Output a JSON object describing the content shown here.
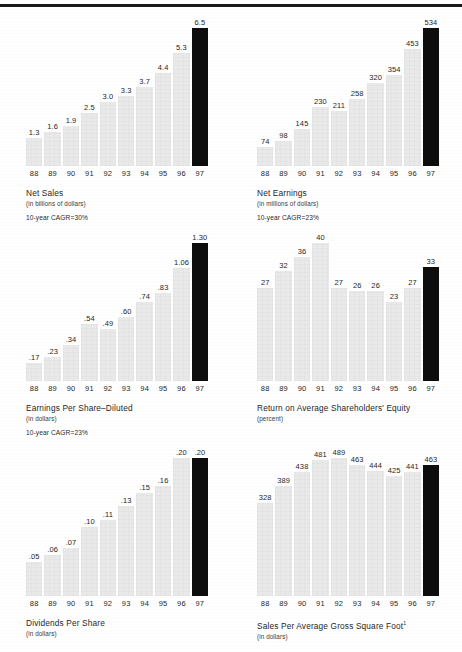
{
  "page": {
    "rule_color": "#1a1a1a",
    "bar_color": "#e9e9e9",
    "highlight_color": "#0d0d0d"
  },
  "years": [
    "88",
    "89",
    "90",
    "91",
    "92",
    "93",
    "94",
    "95",
    "96",
    "97"
  ],
  "charts": [
    {
      "id": "net-sales",
      "title": "Net Sales",
      "subtitle": "(in billions of dollars)",
      "cagr": "10-year CAGR=30%",
      "chart_data": {
        "type": "bar",
        "title": "Net Sales",
        "xlabel": "",
        "ylabel": "in billions of dollars",
        "categories": [
          "88",
          "89",
          "90",
          "91",
          "92",
          "93",
          "94",
          "95",
          "96",
          "97"
        ],
        "values": [
          1.3,
          1.6,
          1.9,
          2.5,
          3.0,
          3.3,
          3.7,
          4.4,
          5.3,
          6.5
        ],
        "labels": [
          "1.3",
          "1.6",
          "1.9",
          "2.5",
          "3.0",
          "3.3",
          "3.7",
          "4.4",
          "5.3",
          "6.5"
        ],
        "ylim": [
          0,
          6.5
        ],
        "grid": false,
        "legend": "none",
        "highlight_index": 9
      }
    },
    {
      "id": "net-earnings",
      "title": "Net Earnings",
      "subtitle": "(in millions of dollars)",
      "cagr": "10-year CAGR=23%",
      "chart_data": {
        "type": "bar",
        "title": "Net Earnings",
        "xlabel": "",
        "ylabel": "in millions of dollars",
        "categories": [
          "88",
          "89",
          "90",
          "91",
          "92",
          "93",
          "94",
          "95",
          "96",
          "97"
        ],
        "values": [
          74,
          98,
          145,
          230,
          211,
          258,
          320,
          354,
          453,
          534
        ],
        "labels": [
          "74",
          "98",
          "145",
          "230",
          "211",
          "258",
          "320",
          "354",
          "453",
          "534"
        ],
        "ylim": [
          0,
          534
        ],
        "grid": false,
        "legend": "none",
        "highlight_index": 9
      }
    },
    {
      "id": "eps-diluted",
      "title": "Earnings Per Share–Diluted",
      "subtitle": "(in dollars)",
      "cagr": "10-year CAGR=23%",
      "chart_data": {
        "type": "bar",
        "title": "Earnings Per Share–Diluted",
        "xlabel": "",
        "ylabel": "in dollars",
        "categories": [
          "88",
          "89",
          "90",
          "91",
          "92",
          "93",
          "94",
          "95",
          "96",
          "97"
        ],
        "values": [
          0.17,
          0.23,
          0.34,
          0.54,
          0.49,
          0.6,
          0.74,
          0.83,
          1.06,
          1.3
        ],
        "labels": [
          ".17",
          ".23",
          ".34",
          ".54",
          ".49",
          ".60",
          ".74",
          ".83",
          "1.06",
          "1.30"
        ],
        "ylim": [
          0,
          1.3
        ],
        "grid": false,
        "legend": "none",
        "highlight_index": 9
      }
    },
    {
      "id": "return-on-equity",
      "title": "Return on Average Shareholders' Equity",
      "subtitle": "(percent)",
      "cagr": "",
      "chart_data": {
        "type": "bar",
        "title": "Return on Average Shareholders' Equity",
        "xlabel": "",
        "ylabel": "percent",
        "categories": [
          "88",
          "89",
          "90",
          "91",
          "92",
          "93",
          "94",
          "95",
          "96",
          "97"
        ],
        "values": [
          27,
          32,
          36,
          40,
          27,
          26,
          26,
          23,
          27,
          33
        ],
        "labels": [
          "27",
          "32",
          "36",
          "40",
          "27",
          "26",
          "26",
          "23",
          "27",
          "33"
        ],
        "ylim": [
          0,
          40
        ],
        "grid": false,
        "legend": "none",
        "highlight_index": 9
      }
    },
    {
      "id": "dividends-per-share",
      "title": "Dividends Per Share",
      "subtitle": "(in dollars)",
      "cagr": "",
      "chart_data": {
        "type": "bar",
        "title": "Dividends Per Share",
        "xlabel": "",
        "ylabel": "in dollars",
        "categories": [
          "88",
          "89",
          "90",
          "91",
          "92",
          "93",
          "94",
          "95",
          "96",
          "97"
        ],
        "values": [
          0.05,
          0.06,
          0.07,
          0.1,
          0.11,
          0.13,
          0.15,
          0.16,
          0.2,
          0.2
        ],
        "labels": [
          ".05",
          ".06",
          ".07",
          ".10",
          ".11",
          ".13",
          ".15",
          ".16",
          ".20",
          ".20"
        ],
        "ylim": [
          0,
          0.2
        ],
        "grid": false,
        "legend": "none",
        "highlight_index": 9
      }
    },
    {
      "id": "sales-per-square-foot",
      "title": "Sales Per Average Gross Square Foot",
      "title_footnote": "1",
      "subtitle": "(in dollars)",
      "cagr": "",
      "chart_data": {
        "type": "bar",
        "title": "Sales Per Average Gross Square Foot",
        "xlabel": "",
        "ylabel": "in dollars",
        "categories": [
          "88",
          "89",
          "90",
          "91",
          "92",
          "93",
          "94",
          "95",
          "96",
          "97"
        ],
        "values": [
          328,
          389,
          438,
          481,
          489,
          463,
          444,
          425,
          441,
          463
        ],
        "labels": [
          "328",
          "389",
          "438",
          "481",
          "489",
          "463",
          "444",
          "425",
          "441",
          "463"
        ],
        "ylim": [
          0,
          489
        ],
        "grid": false,
        "legend": "none",
        "highlight_index": 9
      }
    }
  ]
}
